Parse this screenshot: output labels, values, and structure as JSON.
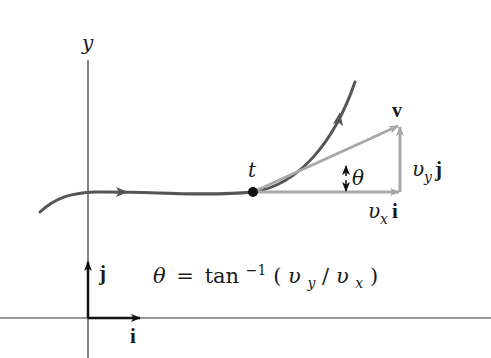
{
  "diagram": {
    "axes": {
      "y_label": "y"
    },
    "point": {
      "label": "t"
    },
    "vectors": {
      "velocity_label": "v",
      "vy_label_base": "υ",
      "vy_label_sub": "y",
      "vy_label_unit": "j",
      "vx_label_base": "υ",
      "vx_label_sub": "x",
      "vx_label_unit": "i"
    },
    "angle": {
      "label": "θ"
    },
    "unit_vectors": {
      "i_label": "i",
      "j_label": "j"
    },
    "formula": {
      "lhs": "θ",
      "eq": "=",
      "fn": "tan",
      "sup": "−1",
      "open": "(",
      "num_base": "υ",
      "num_sub": "y",
      "slash": "/",
      "den_base": "υ",
      "den_sub": "x",
      "close": ")"
    },
    "colors": {
      "curve": "#555555",
      "vector": "#a8a8a8",
      "axis": "#333333",
      "text": "#1a1a1a"
    }
  }
}
